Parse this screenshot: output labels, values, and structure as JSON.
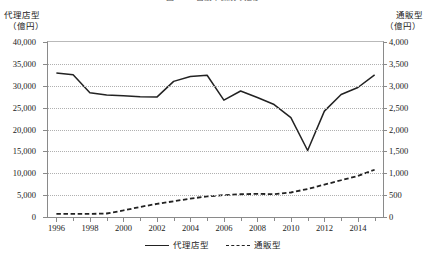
{
  "figure": {
    "title": "図2-12　自動車保険の推移",
    "left_axis_title_line1": "代理店型",
    "left_axis_title_line2": "（億円）",
    "right_axis_title_line1": "通販型",
    "right_axis_title_line2": "（億円）"
  },
  "legend": {
    "position": "bottom-center",
    "items": [
      {
        "label": "代理店型",
        "style": "solid",
        "color": "#222222",
        "icon": "solid-line-icon"
      },
      {
        "label": "通販型",
        "style": "dashed",
        "color": "#222222",
        "icon": "dashed-line-icon"
      }
    ]
  },
  "chart_data": {
    "type": "line",
    "title": "図2-12　自動車保険の推移",
    "xlabel": "",
    "ylabel": "代理店型（億円）",
    "y2label": "通販型（億円）",
    "grid": true,
    "x": [
      1996,
      1997,
      1998,
      1999,
      2000,
      2001,
      2002,
      2003,
      2004,
      2005,
      2006,
      2007,
      2008,
      2009,
      2010,
      2011,
      2012,
      2013,
      2014,
      2015
    ],
    "xlim": [
      1995.5,
      2015.5
    ],
    "xticks_major": [
      1996,
      1998,
      2000,
      2002,
      2004,
      2006,
      2008,
      2010,
      2012,
      2014
    ],
    "xtick_labels": [
      "1996",
      "1998",
      "2000",
      "2002",
      "2004",
      "2006",
      "2008",
      "2010",
      "2012",
      "2014"
    ],
    "xticks_minor": [
      1997,
      1999,
      2001,
      2003,
      2005,
      2007,
      2009,
      2011,
      2013,
      2015
    ],
    "ylim": [
      0,
      40000
    ],
    "yticks": [
      0,
      5000,
      10000,
      15000,
      20000,
      25000,
      30000,
      35000,
      40000
    ],
    "ytick_labels": [
      "0",
      "5,000",
      "10,000",
      "15,000",
      "20,000",
      "25,000",
      "30,000",
      "35,000",
      "40,000"
    ],
    "y2lim": [
      0,
      4000
    ],
    "y2ticks": [
      0,
      500,
      1000,
      1500,
      2000,
      2500,
      3000,
      3500,
      4000
    ],
    "y2tick_labels": [
      "0",
      "500",
      "1,000",
      "1,500",
      "2,000",
      "2,500",
      "3,000",
      "3,500",
      "4,000"
    ],
    "series": [
      {
        "name": "代理店型",
        "axis": "left",
        "style": "solid",
        "color": "#222222",
        "values": [
          32900,
          32500,
          28400,
          27900,
          27700,
          27500,
          27400,
          31000,
          32100,
          32400,
          26700,
          28800,
          27300,
          25700,
          22700,
          15200,
          24200,
          28000,
          29600,
          32500
        ]
      },
      {
        "name": "通販型",
        "axis": "right",
        "style": "dashed",
        "color": "#222222",
        "values": [
          70,
          70,
          70,
          80,
          150,
          230,
          300,
          360,
          420,
          470,
          500,
          520,
          530,
          520,
          560,
          640,
          740,
          840,
          940,
          1080
        ]
      }
    ]
  }
}
